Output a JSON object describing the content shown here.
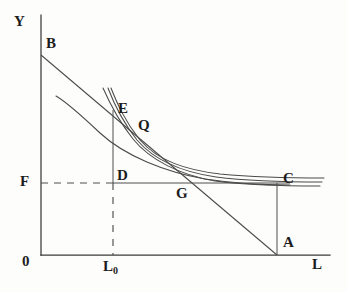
{
  "figure": {
    "kind": "economics-indifference-curve-diagram",
    "title": "",
    "background_color": "#fdfdfc",
    "ink_color": "#3b3b3b"
  },
  "axes": {
    "y_axis_label": "Y",
    "x_axis_label": "L",
    "origin_label": "0",
    "y_axis": {
      "x": 41,
      "y_top": 15,
      "y_bottom": 255
    },
    "x_axis": {
      "y": 255,
      "x_left": 41,
      "x_right": 330
    }
  },
  "tick_labels": [
    {
      "name": "l-zero",
      "text": "L",
      "sub": "0",
      "x": 103,
      "y": 259
    }
  ],
  "point_labels": [
    {
      "name": "point-b",
      "text": "B",
      "x": 46,
      "y": 36
    },
    {
      "name": "point-e",
      "text": "E",
      "x": 118,
      "y": 101
    },
    {
      "name": "point-q",
      "text": "Q",
      "x": 138,
      "y": 118
    },
    {
      "name": "point-d",
      "text": "D",
      "x": 117,
      "y": 168
    },
    {
      "name": "point-g",
      "text": "G",
      "x": 176,
      "y": 186
    },
    {
      "name": "point-c",
      "text": "C",
      "x": 283,
      "y": 171
    },
    {
      "name": "point-a",
      "text": "A",
      "x": 283,
      "y": 235
    },
    {
      "name": "point-f",
      "text": "F",
      "x": 20,
      "y": 174
    },
    {
      "name": "axis-y-label",
      "text": "Y",
      "x": 14,
      "y": 14
    },
    {
      "name": "axis-l-label",
      "text": "L",
      "x": 312,
      "y": 257
    },
    {
      "name": "origin-zero",
      "text": "0",
      "x": 22,
      "y": 254
    }
  ],
  "geometry": {
    "point_B": {
      "x": 41,
      "y": 55
    },
    "point_A": {
      "x": 277,
      "y": 255
    },
    "point_E": {
      "x": 113,
      "y": 113
    },
    "point_D": {
      "x": 113,
      "y": 183
    },
    "point_G": {
      "x": 178,
      "y": 183
    },
    "point_C": {
      "x": 277,
      "y": 183
    },
    "wage_floor_level_F_y": 183,
    "labour_L0_x": 113
  },
  "curves": [
    {
      "name": "indifference-curve-upper",
      "role": "indifference curve passing through E (upper)",
      "path": "M 103 88 C 110 104, 118 120, 133 139 C 150 160, 180 175, 215 181 C 245 185, 285 186, 320 186"
    },
    {
      "name": "indifference-curve-middle",
      "role": "indifference curve through E (middle)",
      "path": "M 108 88 C 114 104, 122 121, 137 140 C 154 160, 182 172, 216 177 C 248 181, 288 182, 322 182"
    },
    {
      "name": "indifference-curve-lower",
      "role": "indifference curve through E (lower)",
      "path": "M 111 88 C 117 103, 124 120, 140 140 C 158 161, 186 170, 220 174 C 252 177, 290 178, 324 178"
    },
    {
      "name": "production-frontier-curve",
      "role": "lower convex curve from upper-left toward C",
      "path": "M 56 96 C 68 103, 82 116, 100 133 C 125 156, 165 172, 205 179 C 238 184, 268 185, 290 185"
    }
  ],
  "lines": [
    {
      "name": "budget-line-BA",
      "role": "budget / isoprofit line from B to A",
      "style": "solid",
      "from": {
        "x": 41,
        "y": 55
      },
      "to": {
        "x": 277,
        "y": 255
      }
    },
    {
      "name": "wage-floor-line-F-to-D",
      "role": "dashed segment of wage floor F from Y axis to D",
      "style": "dashed",
      "from": {
        "x": 41,
        "y": 183
      },
      "to": {
        "x": 113,
        "y": 183
      }
    },
    {
      "name": "wage-floor-line-D-to-C",
      "role": "solid segment of wage floor from D through G to C",
      "style": "solid",
      "from": {
        "x": 113,
        "y": 183
      },
      "to": {
        "x": 290,
        "y": 183
      }
    },
    {
      "name": "vertical-line-E-to-D",
      "role": "solid vertical at L0 from E down to D",
      "style": "solid",
      "from": {
        "x": 113,
        "y": 110
      },
      "to": {
        "x": 113,
        "y": 183
      }
    },
    {
      "name": "vertical-line-D-to-L0",
      "role": "dashed vertical at L0 from D down to x-axis",
      "style": "dashed",
      "from": {
        "x": 113,
        "y": 183
      },
      "to": {
        "x": 113,
        "y": 255
      }
    },
    {
      "name": "vertical-line-C-to-A",
      "role": "solid vertical from C down to A",
      "style": "solid",
      "from": {
        "x": 277,
        "y": 183
      },
      "to": {
        "x": 277,
        "y": 255
      }
    }
  ]
}
